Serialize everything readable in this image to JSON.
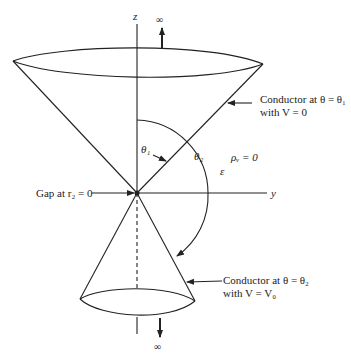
{
  "diagram": {
    "axes": {
      "z_label": "z",
      "y_label": "y"
    },
    "infinity_top": "∞",
    "infinity_bottom": "∞",
    "angles": {
      "theta1": "θ₁",
      "theta2": "θ₂"
    },
    "region": {
      "charge": "ρᵥ = 0",
      "permittivity": "ε"
    },
    "gap_label": "Gap at r₂ = 0",
    "upper_conductor": {
      "line1": "Conductor at θ = θ₁",
      "line2": "with V = 0"
    },
    "lower_conductor": {
      "line1": "Conductor at θ = θ₂",
      "line2": "with V = V₀"
    }
  }
}
